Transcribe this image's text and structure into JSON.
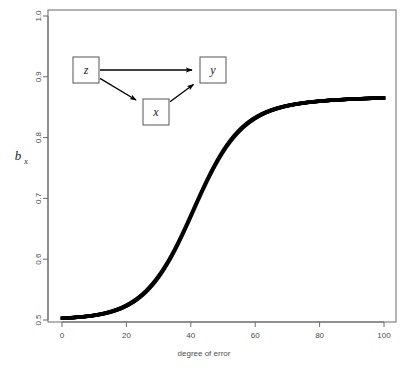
{
  "figure": {
    "width": 408,
    "height": 371,
    "background": "#ffffff",
    "frame_color": "#6b6b6b",
    "point_color": "#000000"
  },
  "chart_data": {
    "type": "scatter",
    "title": "",
    "xlabel": "degree of error",
    "ylabel": "b_x",
    "ylabel_base": "b",
    "ylabel_subscript": "x",
    "xlim": [
      0,
      100
    ],
    "ylim": [
      0.5,
      1.0
    ],
    "xticks": [
      0,
      20,
      40,
      60,
      80,
      100
    ],
    "xtick_labels": [
      "0",
      "20",
      "40",
      "60",
      "80",
      "100"
    ],
    "yticks": [
      0.5,
      0.6,
      0.7,
      0.8,
      0.9,
      1.0
    ],
    "ytick_labels": [
      "0.5",
      "0.6",
      "0.7",
      "0.8",
      "0.9",
      "1.0"
    ],
    "grid": false,
    "legend": null,
    "ytick_label_rotation": -90,
    "series": [
      {
        "name": "b_x vs degree of error",
        "marker": "filled-square",
        "marker_size": 3,
        "color": "#000000",
        "x": [
          0,
          1,
          2,
          3,
          4,
          5,
          6,
          7,
          8,
          9,
          10,
          11,
          12,
          13,
          14,
          15,
          16,
          17,
          18,
          19,
          20,
          21,
          22,
          23,
          24,
          25,
          26,
          27,
          28,
          29,
          30,
          31,
          32,
          33,
          34,
          35,
          36,
          37,
          38,
          39,
          40,
          41,
          42,
          43,
          44,
          45,
          46,
          47,
          48,
          49,
          50,
          51,
          52,
          53,
          54,
          55,
          56,
          57,
          58,
          59,
          60,
          61,
          62,
          63,
          64,
          65,
          66,
          67,
          68,
          69,
          70,
          71,
          72,
          73,
          74,
          75,
          76,
          77,
          78,
          79,
          80,
          81,
          82,
          83,
          84,
          85,
          86,
          87,
          88,
          89,
          90,
          91,
          92,
          93,
          94,
          95,
          96,
          97,
          98,
          99,
          100
        ],
        "y": [
          0.503,
          0.5032,
          0.5035,
          0.5038,
          0.5042,
          0.5046,
          0.505,
          0.5056,
          0.5062,
          0.5068,
          0.5076,
          0.5085,
          0.5095,
          0.5106,
          0.5119,
          0.5133,
          0.5149,
          0.5167,
          0.5187,
          0.521,
          0.5236,
          0.5265,
          0.5297,
          0.5333,
          0.5373,
          0.5417,
          0.5466,
          0.552,
          0.5579,
          0.5644,
          0.5714,
          0.579,
          0.5872,
          0.596,
          0.6053,
          0.6152,
          0.6256,
          0.6365,
          0.6477,
          0.6593,
          0.671,
          0.6829,
          0.6947,
          0.7064,
          0.7178,
          0.7289,
          0.7396,
          0.7498,
          0.7595,
          0.7687,
          0.7772,
          0.7852,
          0.7925,
          0.7993,
          0.8055,
          0.8111,
          0.8163,
          0.8209,
          0.8251,
          0.8289,
          0.8323,
          0.8354,
          0.8382,
          0.8407,
          0.8429,
          0.8449,
          0.8467,
          0.8484,
          0.8498,
          0.8512,
          0.8524,
          0.8535,
          0.8545,
          0.8554,
          0.8562,
          0.857,
          0.8577,
          0.8583,
          0.8589,
          0.8594,
          0.8599,
          0.8604,
          0.8608,
          0.8612,
          0.8616,
          0.8619,
          0.8622,
          0.8625,
          0.8628,
          0.8631,
          0.8633,
          0.8636,
          0.8638,
          0.864,
          0.8642,
          0.8644,
          0.8646,
          0.8648,
          0.8649,
          0.8651,
          0.8652
        ]
      }
    ]
  },
  "path_diagram": {
    "nodes": [
      {
        "id": "z",
        "label": "z",
        "x": 73,
        "y": 57,
        "w": 26,
        "h": 26
      },
      {
        "id": "x",
        "label": "x",
        "x": 143,
        "y": 99,
        "w": 26,
        "h": 26
      },
      {
        "id": "y",
        "label": "y",
        "x": 200,
        "y": 57,
        "w": 26,
        "h": 26
      }
    ],
    "edges": [
      {
        "from": "z",
        "to": "y",
        "label": ""
      },
      {
        "from": "z",
        "to": "x",
        "label": ""
      },
      {
        "from": "x",
        "to": "y",
        "label": ""
      }
    ]
  }
}
